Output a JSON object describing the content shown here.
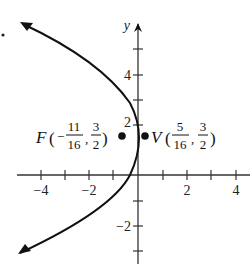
{
  "diagram": {
    "type": "parabola-graph",
    "equation_implied": "x - 5/16 = -(1/4)(y - 3/2)^2",
    "axis": {
      "x_label": "",
      "y_label": "y"
    },
    "x_ticks": [
      -4,
      -3,
      -2,
      -1,
      1,
      2,
      3,
      4
    ],
    "x_tick_labels": [
      "−4",
      "−2",
      "2",
      "4"
    ],
    "y_ticks": [
      -3,
      -2,
      -1,
      1,
      2,
      3,
      4,
      6
    ],
    "y_tick_labels": [
      "−2",
      "2",
      "4"
    ],
    "points": [
      {
        "letter": "F",
        "x_num": "11",
        "x_den": "16",
        "x_sign": "−",
        "y_num": "3",
        "y_den": "2",
        "x": -0.6875,
        "y": 1.5
      },
      {
        "letter": "V",
        "x_num": "5",
        "x_den": "16",
        "x_sign": "",
        "y_num": "3",
        "y_den": "2",
        "x": 0.3125,
        "y": 1.5
      }
    ],
    "colors": {
      "ink": "#111111",
      "background": "#ffffff"
    }
  }
}
